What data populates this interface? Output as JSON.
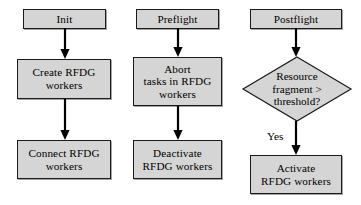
{
  "diagram": {
    "style": {
      "node_fill": "#d5d5d5",
      "node_border": "#1a1a1a",
      "arrow_color": "#000000",
      "background": "#ffffff",
      "text_color": "#000000"
    },
    "columns": [
      {
        "name": "init-column",
        "header": "Init",
        "nodes": [
          {
            "id": "init",
            "label": "Init",
            "shape": "rectangle"
          },
          {
            "id": "create-rfdg-workers",
            "label": "Create RFDG\nworkers",
            "shape": "rectangle"
          },
          {
            "id": "connect-rfdg-workers",
            "label": "Connect RFDG\nworkers",
            "shape": "rectangle"
          }
        ]
      },
      {
        "name": "preflight-column",
        "header": "Preflight",
        "nodes": [
          {
            "id": "preflight",
            "label": "Preflight",
            "shape": "rectangle"
          },
          {
            "id": "abort-tasks",
            "label": "Abort\ntasks in RFDG\nworkers",
            "shape": "rectangle"
          },
          {
            "id": "deactivate-rfdg-workers",
            "label": "Deactivate\nRFDG workers",
            "shape": "rectangle"
          }
        ]
      },
      {
        "name": "postflight-column",
        "header": "Postflight",
        "nodes": [
          {
            "id": "postflight",
            "label": "Postflight",
            "shape": "rectangle"
          },
          {
            "id": "resource-fragment-decision",
            "label": "Resource\nfragment >\nthreshold?",
            "shape": "diamond"
          },
          {
            "id": "activate-rfdg-workers",
            "label": "Activate\nRFDG workers",
            "shape": "rectangle"
          }
        ]
      }
    ],
    "edges": [
      {
        "id": "init-to-create",
        "from": "init",
        "to": "create-rfdg-workers",
        "label": ""
      },
      {
        "id": "create-to-connect",
        "from": "create-rfdg-workers",
        "to": "connect-rfdg-workers",
        "label": ""
      },
      {
        "id": "preflight-to-abort",
        "from": "preflight",
        "to": "abort-tasks",
        "label": ""
      },
      {
        "id": "abort-to-deactivate",
        "from": "abort-tasks",
        "to": "deactivate-rfdg-workers",
        "label": ""
      },
      {
        "id": "postflight-to-decision",
        "from": "postflight",
        "to": "resource-fragment-decision",
        "label": ""
      },
      {
        "id": "decision-to-activate",
        "from": "resource-fragment-decision",
        "to": "activate-rfdg-workers",
        "label": "Yes"
      }
    ]
  }
}
